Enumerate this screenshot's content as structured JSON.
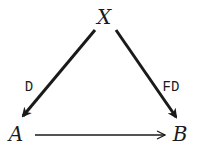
{
  "diagram": {
    "type": "commutative-triangle",
    "nodes": {
      "top": "X",
      "left": "A",
      "right": "B"
    },
    "edges": [
      {
        "from": "X",
        "to": "A",
        "label": "D",
        "weight": "bold"
      },
      {
        "from": "X",
        "to": "B",
        "label": "FD",
        "weight": "bold"
      },
      {
        "from": "A",
        "to": "B",
        "label": "",
        "weight": "thin"
      }
    ],
    "labels": {
      "left_edge": "D",
      "right_edge": "FD"
    },
    "colors": {
      "ink": "#1a1a1a",
      "background": "#ffffff"
    }
  }
}
